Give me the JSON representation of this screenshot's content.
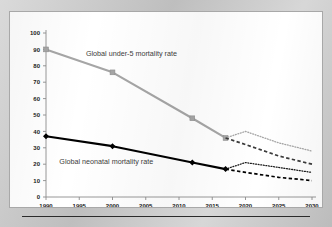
{
  "chart_data": {
    "type": "line",
    "title": "",
    "subtitle": "",
    "xlabel": "",
    "ylabel": "",
    "xlim": [
      1990,
      2030
    ],
    "ylim": [
      0,
      100
    ],
    "xticks": [
      "1990",
      "1995",
      "2000",
      "2005",
      "2010",
      "2015",
      "2020",
      "2025",
      "2030"
    ],
    "yticks": [
      "0",
      "10",
      "20",
      "30",
      "40",
      "50",
      "60",
      "70",
      "80",
      "90",
      "100"
    ],
    "grid": false,
    "legend_position": "inline-annotation",
    "colors": {
      "under5": "#a6a6a6",
      "neonatal": "#000000",
      "axis": "#8c8c8c",
      "text": "#1b1b1b",
      "card_background": "#ffffff",
      "page_background": "#c6c6c6"
    },
    "annotations": [
      {
        "id": "under5-label",
        "text": "Global under-5 mortality rate",
        "x": 1996.0,
        "y": 86
      },
      {
        "id": "neonatal-label",
        "text": "Global neonatal mortality rate",
        "x": 1992.0,
        "y": 20
      }
    ],
    "series": [
      {
        "name": "Global under-5 mortality rate",
        "style": "solid",
        "color": "#a6a6a6",
        "markers": true,
        "x": [
          1990,
          2000,
          2012,
          2017
        ],
        "values": [
          90,
          76,
          48,
          36
        ]
      },
      {
        "name": "Global neonatal mortality rate",
        "style": "solid",
        "color": "#000000",
        "markers": true,
        "x": [
          1990,
          2000,
          2012,
          2017
        ],
        "values": [
          37,
          31,
          21,
          17
        ]
      },
      {
        "name": "Global under-5 mortality rate projection (current trend)",
        "style": "dotted",
        "color": "#a6a6a6",
        "markers": false,
        "x": [
          2017,
          2020,
          2025,
          2030
        ],
        "values": [
          36,
          40,
          33,
          28
        ]
      },
      {
        "name": "Global under-5 mortality rate projection (SDG target)",
        "style": "dashed",
        "color": "#3a3a3a",
        "markers": false,
        "x": [
          2017,
          2020,
          2025,
          2030
        ],
        "values": [
          36,
          32,
          25,
          20
        ]
      },
      {
        "name": "Global neonatal mortality rate projection (current trend)",
        "style": "dotted",
        "color": "#1b1b1b",
        "markers": false,
        "x": [
          2017,
          2020,
          2025,
          2030
        ],
        "values": [
          17,
          21,
          18,
          15
        ]
      },
      {
        "name": "Global neonatal mortality rate projection (SDG target)",
        "style": "dashed",
        "color": "#000000",
        "markers": false,
        "x": [
          2017,
          2020,
          2025,
          2030
        ],
        "values": [
          17,
          15,
          12,
          10
        ]
      }
    ]
  }
}
